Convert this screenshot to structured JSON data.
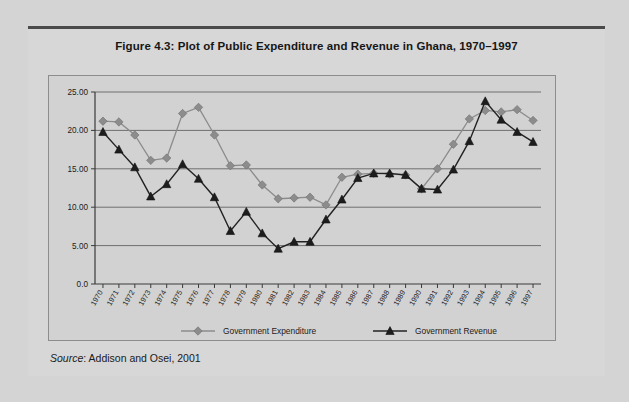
{
  "figure": {
    "title": "Figure 4.3:  Plot of Public Expenditure and Revenue in Ghana, 1970–1997",
    "source_label": "Source",
    "source_rest": ": Addison and Osei, 2001"
  },
  "colors": {
    "expenditure": "#8c8c8c",
    "revenue": "#1d1d1d",
    "page_background": "#d4d4d4",
    "card_background": "#d7d7d7",
    "plot_background": "#d2d2d2",
    "gridline": "#6f6f6f",
    "axis": "#3a3a3a"
  },
  "chart_data": {
    "type": "line",
    "title": "Figure 4.3:  Plot of Public Expenditure and Revenue in Ghana, 1970–1997",
    "xlabel": "",
    "ylabel": "",
    "ylim": [
      0,
      25
    ],
    "yticks": [
      0,
      5,
      10,
      15,
      20,
      25
    ],
    "ytick_labels": [
      "0.0",
      "5.00",
      "10.00",
      "15.00",
      "20.00",
      "25.00"
    ],
    "grid": true,
    "legend_position": "bottom",
    "categories": [
      "1970",
      "1971",
      "1972",
      "1973",
      "1974",
      "1975",
      "1976",
      "1977",
      "1978",
      "1979",
      "1980",
      "1981",
      "1982",
      "1983",
      "1984",
      "1985",
      "1986",
      "1987",
      "1988",
      "1989",
      "1990",
      "1991",
      "1992",
      "1993",
      "1994",
      "1995",
      "1996",
      "1997"
    ],
    "series": [
      {
        "name": "Government Expenditure",
        "marker": "diamond",
        "color": "#8c8c8c",
        "values": [
          21.2,
          21.1,
          19.4,
          16.1,
          16.4,
          22.2,
          23.0,
          19.4,
          15.4,
          15.5,
          12.9,
          11.1,
          11.2,
          11.3,
          10.3,
          13.9,
          14.3,
          14.4,
          14.3,
          14.2,
          12.4,
          15.0,
          18.2,
          21.5,
          22.6,
          22.4,
          22.7,
          21.3
        ]
      },
      {
        "name": "Government Revenue",
        "marker": "triangle",
        "color": "#1d1d1d",
        "values": [
          19.8,
          17.5,
          15.2,
          11.4,
          13.0,
          15.6,
          13.7,
          11.3,
          6.9,
          9.4,
          6.6,
          4.6,
          5.5,
          5.5,
          8.4,
          11.0,
          13.8,
          14.4,
          14.4,
          14.2,
          12.4,
          12.3,
          14.9,
          18.6,
          23.8,
          21.4,
          19.8,
          18.5
        ]
      }
    ],
    "legend": [
      {
        "label": "Government Expenditure",
        "marker": "diamond",
        "color": "#8c8c8c"
      },
      {
        "label": "Government Revenue",
        "marker": "triangle",
        "color": "#1d1d1d"
      }
    ]
  }
}
